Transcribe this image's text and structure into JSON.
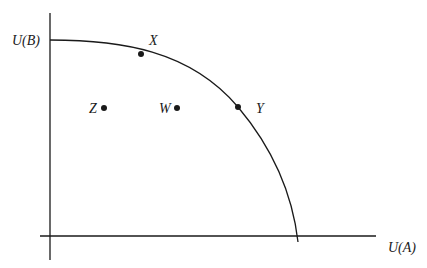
{
  "diagram": {
    "type": "utility-possibility-frontier",
    "axes": {
      "x_label": "U(A)",
      "y_label": "U(B)"
    },
    "points": [
      {
        "name": "X",
        "label": "X",
        "on_frontier": true
      },
      {
        "name": "Y",
        "label": "Y",
        "on_frontier": true
      },
      {
        "name": "W",
        "label": "W",
        "on_frontier": false
      },
      {
        "name": "Z",
        "label": "Z",
        "on_frontier": false
      }
    ],
    "colors": {
      "line": "#1a1a1a",
      "background": "#ffffff"
    }
  }
}
